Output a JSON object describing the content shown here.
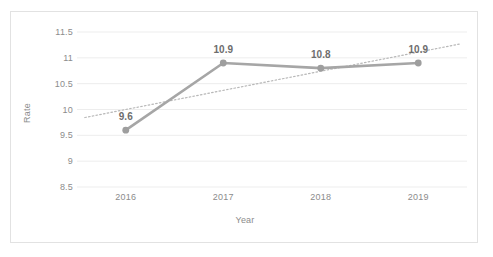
{
  "caption": {
    "text": "........................."
  },
  "chart_data": {
    "type": "line",
    "title": "",
    "xlabel": "Year",
    "ylabel": "Rate",
    "categories": [
      "2016",
      "2017",
      "2018",
      "2019"
    ],
    "values": [
      9.6,
      10.9,
      10.8,
      10.9
    ],
    "point_labels": [
      "9.6",
      "10.9",
      "10.8",
      "10.9"
    ],
    "ylim": [
      8.5,
      11.5
    ],
    "yticks": [
      11.5,
      11,
      10.5,
      10,
      9.5,
      9,
      8.5
    ],
    "ytick_labels": [
      "11.5",
      "11",
      "10.5",
      "10",
      "9.5",
      "9",
      "8.5"
    ],
    "grid": true,
    "legend": "none",
    "series": [
      {
        "name": "Rate",
        "style": "solid",
        "marker": "circle",
        "color": "#a6a6a6",
        "values": [
          9.6,
          10.9,
          10.8,
          10.9
        ]
      },
      {
        "name": "Linear trendline",
        "style": "dotted",
        "marker": "none",
        "color": "#b8b8b8",
        "values": [
          10.0,
          10.37,
          10.74,
          11.11
        ]
      }
    ],
    "colors": {
      "line": "#a6a6a6",
      "marker": "#9e9e9e",
      "trendline": "#bcbcbc",
      "gridline": "#ededed",
      "axis_text": "#8c8c8c",
      "label_text": "#6d6d6d",
      "frame": "#e2e2e2",
      "background": "#ffffff"
    }
  }
}
